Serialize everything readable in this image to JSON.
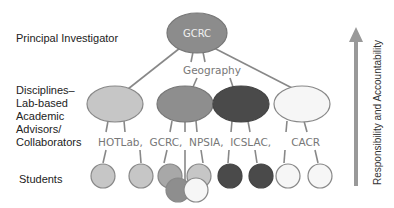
{
  "levels": {
    "pi": "Principal Investigator",
    "advisors": [
      "Disciplines–",
      "Lab-based",
      "Academic",
      "Advisors/",
      "Collaborators"
    ],
    "students": "Students"
  },
  "nodes": {
    "root": "GCRC",
    "discipline": "Geography",
    "labs_row": "HOTLab,  GCRC,  NPSIA,  ICSLAC,      CACR"
  },
  "arrow_label": "Responsibility and Accountability",
  "colors": {
    "root": "#8c8c8c",
    "light": "#c6c6c6",
    "mid": "#8e8e8e",
    "dark": "#4a4a4a",
    "white": "#f6f6f6",
    "stroke": "#888888",
    "arrow": "#999999"
  }
}
